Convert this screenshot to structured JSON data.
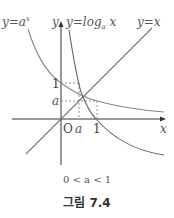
{
  "figure": {
    "labels": {
      "exp_curve": "y=a",
      "exp_sup": "x",
      "y_axis": "y",
      "log_curve": "y=log",
      "log_sub": "a",
      "log_var": " x",
      "identity": "y=x",
      "x_axis": "x",
      "origin": "O",
      "tick_a_x": "a",
      "tick_1_x": "1",
      "tick_1_y": "1",
      "tick_a_y": "a"
    },
    "condition": "0 < a < 1",
    "caption": "그림 7.4",
    "colors": {
      "curves": "#777777",
      "axes": "#333333"
    }
  }
}
